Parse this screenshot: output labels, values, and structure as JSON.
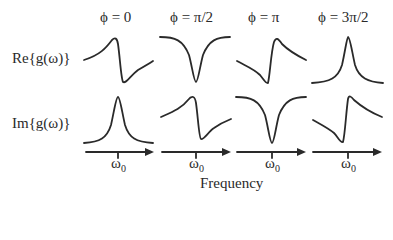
{
  "row_labels": {
    "real": "Re{g(ω)}",
    "imag": "Im{g(ω)}"
  },
  "columns": [
    {
      "phase": "ϕ = 0",
      "real_shape": "dispersive (peak then dip)",
      "imag_shape": "absorptive peak"
    },
    {
      "phase": "ϕ = π/2",
      "real_shape": "absorptive dip",
      "imag_shape": "dispersive (peak then dip)"
    },
    {
      "phase": "ϕ = π",
      "real_shape": "dispersive (dip then peak)",
      "imag_shape": "absorptive dip"
    },
    {
      "phase": "ϕ = 3π/2",
      "real_shape": "absorptive peak",
      "imag_shape": "dispersive (dip then peak)"
    }
  ],
  "axis": {
    "tick_label": "ω",
    "tick_sub": "0",
    "xlabel": "Frequency"
  },
  "colors": {
    "line": "#2a2a2a",
    "background": "#ffffff"
  }
}
